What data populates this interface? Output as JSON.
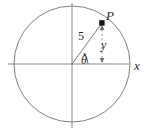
{
  "figure": {
    "kind": "unit-circle-trig-diagram",
    "labels": {
      "point": "P",
      "radius": "5",
      "angle": "θ",
      "vertical": "y",
      "x_axis": "x"
    },
    "colors": {
      "stroke": "#6b6b6b",
      "axis": "#7a7a7a",
      "text": "#2b2b2b",
      "point_fill": "#1a1a1a",
      "background": "#ffffff"
    },
    "geometry": {
      "center_x": 72,
      "center_y": 64,
      "radius_px": 58,
      "point_x": 102,
      "point_y": 23,
      "radius_value": 5,
      "x_axis_start": 8,
      "x_axis_end": 129,
      "y_axis_start": 3,
      "y_axis_end": 128
    }
  }
}
